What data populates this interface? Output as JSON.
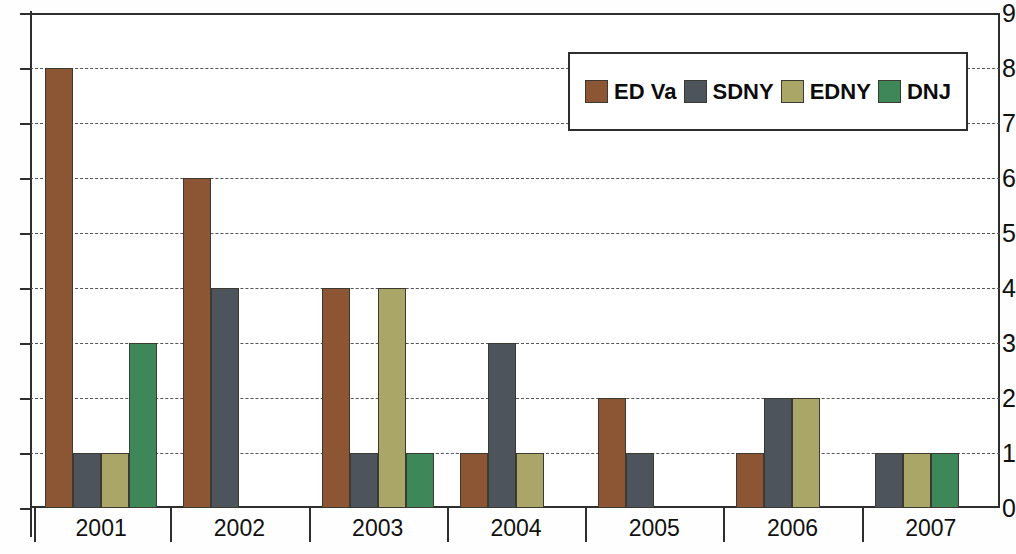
{
  "chart_data": {
    "type": "bar",
    "title": "",
    "xlabel": "",
    "ylabel": "",
    "categories": [
      "2001",
      "2002",
      "2003",
      "2004",
      "2005",
      "2006",
      "2007"
    ],
    "ylim": [
      0,
      9
    ],
    "y_ticks": [
      0,
      1,
      2,
      3,
      4,
      5,
      6,
      7,
      8,
      9
    ],
    "grid": true,
    "grid_axis": "y",
    "legend_position": "top-right",
    "series": [
      {
        "name": "ED Va",
        "color": "#8c5533",
        "values": [
          8,
          6,
          4,
          1,
          2,
          1,
          0
        ]
      },
      {
        "name": "SDNY",
        "color": "#4d545c",
        "values": [
          1,
          4,
          1,
          3,
          1,
          2,
          1
        ]
      },
      {
        "name": "EDNY",
        "color": "#a9a667",
        "values": [
          1,
          0,
          4,
          1,
          0,
          2,
          1
        ]
      },
      {
        "name": "DNJ",
        "color": "#3d8758",
        "values": [
          3,
          0,
          1,
          0,
          0,
          0,
          1
        ]
      }
    ]
  },
  "axis": {
    "y_tick_labels": [
      "0",
      "1",
      "2",
      "3",
      "4",
      "5",
      "6",
      "7",
      "8",
      "9"
    ],
    "x_tick_labels": [
      "2001",
      "2002",
      "2003",
      "2004",
      "2005",
      "2006",
      "2007"
    ]
  },
  "legend": {
    "entries": [
      {
        "label": "ED Va",
        "color": "#8c5533"
      },
      {
        "label": "SDNY",
        "color": "#4d545c"
      },
      {
        "label": "EDNY",
        "color": "#a9a667"
      },
      {
        "label": "DNJ",
        "color": "#3d8758"
      }
    ]
  }
}
